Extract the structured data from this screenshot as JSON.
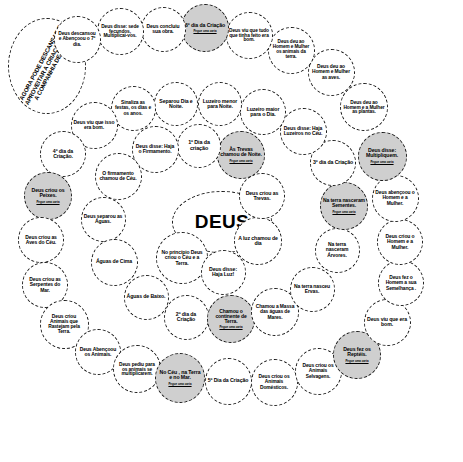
{
  "board": {
    "title": "DEUS",
    "draw_card_label": "Pegue uma carta",
    "colors": {
      "outline": "#1a1a1a",
      "highlight_fill": "#cfcfcf",
      "background": "#ffffff"
    },
    "center": {
      "label": "DEUS"
    },
    "start": {
      "label": "AGORA PODE DESCANSAR E APROVEITAR A CRIAÇÃO COM A COMPANHIA DE DEUS."
    },
    "nodes": [
      {
        "id": "n01",
        "label": "No princípio Deus criou o Céu e a Terra.",
        "highlight": false,
        "draw_card": false,
        "x": 182,
        "y": 258,
        "d": 52,
        "fs": 5.0
      },
      {
        "id": "n02",
        "label": "Deus disse: Haja Luz!",
        "highlight": false,
        "draw_card": false,
        "x": 223,
        "y": 272,
        "d": 45,
        "fs": 5.2
      },
      {
        "id": "n03",
        "label": "A luz chamou de dia",
        "highlight": false,
        "draw_card": false,
        "x": 258,
        "y": 241,
        "d": 48,
        "fs": 5.2
      },
      {
        "id": "n04",
        "label": "Deus criou as Trevas.",
        "highlight": false,
        "draw_card": false,
        "x": 262,
        "y": 196,
        "d": 46,
        "fs": 5.2
      },
      {
        "id": "n05",
        "label": "Às Trevas chamou de Noite.",
        "highlight": true,
        "draw_card": true,
        "x": 241,
        "y": 155,
        "d": 48,
        "fs": 5.2
      },
      {
        "id": "n06",
        "label": "1º Dia da criação",
        "highlight": false,
        "draw_card": false,
        "x": 199,
        "y": 146,
        "d": 44,
        "fs": 5.4
      },
      {
        "id": "n07",
        "label": "Deus disse: Haja o Firmamento.",
        "highlight": false,
        "draw_card": false,
        "x": 155,
        "y": 149,
        "d": 47,
        "fs": 5.0
      },
      {
        "id": "n08",
        "label": "O firmamento chamou de Céu.",
        "highlight": false,
        "draw_card": false,
        "x": 118,
        "y": 176,
        "d": 47,
        "fs": 5.0
      },
      {
        "id": "n09",
        "label": "Deus separou as Águas.",
        "highlight": false,
        "draw_card": false,
        "x": 103,
        "y": 219,
        "d": 45,
        "fs": 5.0
      },
      {
        "id": "n10",
        "label": "Águas de Cima",
        "highlight": false,
        "draw_card": false,
        "x": 114,
        "y": 262,
        "d": 47,
        "fs": 5.2
      },
      {
        "id": "n11",
        "label": "Águas de Baixo.",
        "highlight": false,
        "draw_card": false,
        "x": 146,
        "y": 297,
        "d": 45,
        "fs": 5.2
      },
      {
        "id": "n12",
        "label": "2º dia da Criação",
        "highlight": false,
        "draw_card": false,
        "x": 186,
        "y": 317,
        "d": 45,
        "fs": 5.2
      },
      {
        "id": "n13",
        "label": "Chamou o continente de Terra.",
        "highlight": true,
        "draw_card": true,
        "x": 231,
        "y": 319,
        "d": 48,
        "fs": 5.0
      },
      {
        "id": "n14",
        "label": "Chamou a Massa das águas de Mares.",
        "highlight": false,
        "draw_card": false,
        "x": 275,
        "y": 312,
        "d": 48,
        "fs": 4.9
      },
      {
        "id": "n15",
        "label": "Na terra nasceu Ervas.",
        "highlight": false,
        "draw_card": false,
        "x": 312,
        "y": 289,
        "d": 45,
        "fs": 5.0
      },
      {
        "id": "n16",
        "label": "Na terra nasceram Árvores.",
        "highlight": false,
        "draw_card": false,
        "x": 337,
        "y": 250,
        "d": 45,
        "fs": 5.0
      },
      {
        "id": "n17",
        "label": "Na terra nasceram Sementes.",
        "highlight": true,
        "draw_card": true,
        "x": 344,
        "y": 206,
        "d": 48,
        "fs": 5.0
      },
      {
        "id": "n18",
        "label": "3º dia da Criação",
        "highlight": false,
        "draw_card": false,
        "x": 333,
        "y": 163,
        "d": 46,
        "fs": 5.2
      },
      {
        "id": "n19",
        "label": "Deus disse: Haja Luzeiros no Céu.",
        "highlight": false,
        "draw_card": false,
        "x": 303,
        "y": 131,
        "d": 47,
        "fs": 5.0
      },
      {
        "id": "n20",
        "label": "Luzeiro maior para o Dia.",
        "highlight": false,
        "draw_card": false,
        "x": 263,
        "y": 112,
        "d": 46,
        "fs": 5.2
      },
      {
        "id": "n21",
        "label": "Luzeiro menor para Noite.",
        "highlight": false,
        "draw_card": false,
        "x": 220,
        "y": 104,
        "d": 44,
        "fs": 5.2
      },
      {
        "id": "n22",
        "label": "Separou Dia e Noite.",
        "highlight": false,
        "draw_card": false,
        "x": 176,
        "y": 104,
        "d": 44,
        "fs": 5.2
      },
      {
        "id": "n23",
        "label": "Sinaliza as festas, os dias e os anos.",
        "highlight": false,
        "draw_card": false,
        "x": 133,
        "y": 108,
        "d": 45,
        "fs": 4.9
      },
      {
        "id": "n24",
        "label": "Deus viu que isso era bom.",
        "highlight": false,
        "draw_card": false,
        "x": 94,
        "y": 125,
        "d": 47,
        "fs": 5.0
      },
      {
        "id": "n25",
        "label": "4º dia da Criação.",
        "highlight": false,
        "draw_card": false,
        "x": 63,
        "y": 154,
        "d": 46,
        "fs": 5.2
      },
      {
        "id": "n26",
        "label": "Deus criou os Peixes.",
        "highlight": true,
        "draw_card": true,
        "x": 48,
        "y": 196,
        "d": 48,
        "fs": 5.2
      },
      {
        "id": "n27",
        "label": "Deus criou as Aves do Céu.",
        "highlight": false,
        "draw_card": false,
        "x": 41,
        "y": 240,
        "d": 46,
        "fs": 5.0
      },
      {
        "id": "n28",
        "label": "Deus criou as Serpentes do Mar.",
        "highlight": false,
        "draw_card": false,
        "x": 45,
        "y": 285,
        "d": 46,
        "fs": 5.0
      },
      {
        "id": "n29",
        "label": "Deus criou Animais que Rastejam pela Terra.",
        "highlight": false,
        "draw_card": false,
        "x": 64,
        "y": 324,
        "d": 49,
        "fs": 4.9
      },
      {
        "id": "n30",
        "label": "Deus Abençoou os Animais.",
        "highlight": false,
        "draw_card": false,
        "x": 98,
        "y": 352,
        "d": 46,
        "fs": 5.0
      },
      {
        "id": "n31",
        "label": "Deus pediu para os animais se multiplicarem.",
        "highlight": false,
        "draw_card": false,
        "x": 137,
        "y": 369,
        "d": 48,
        "fs": 4.8
      },
      {
        "id": "n32",
        "label": "No Céu , na Terra e no Mar.",
        "highlight": true,
        "draw_card": true,
        "x": 180,
        "y": 378,
        "d": 50,
        "fs": 5.2
      },
      {
        "id": "n33",
        "label": "5º Dia da Criação",
        "highlight": false,
        "draw_card": false,
        "x": 228,
        "y": 381,
        "d": 47,
        "fs": 5.2
      },
      {
        "id": "n34",
        "label": "Deus criou os Animais Domésticos.",
        "highlight": false,
        "draw_card": false,
        "x": 274,
        "y": 382,
        "d": 47,
        "fs": 4.9
      },
      {
        "id": "n35",
        "label": "Deus criou os Animais Selvagens.",
        "highlight": false,
        "draw_card": false,
        "x": 318,
        "y": 371,
        "d": 47,
        "fs": 4.9
      },
      {
        "id": "n36",
        "label": "Deus fez os Reptéis.",
        "highlight": true,
        "draw_card": true,
        "x": 357,
        "y": 355,
        "d": 48,
        "fs": 5.2
      },
      {
        "id": "n37",
        "label": "Deus viu que era bom.",
        "highlight": false,
        "draw_card": false,
        "x": 387,
        "y": 322,
        "d": 47,
        "fs": 5.2
      },
      {
        "id": "n38",
        "label": "Deus fez o Homem a sua Semelhança .",
        "highlight": false,
        "draw_card": false,
        "x": 401,
        "y": 283,
        "d": 46,
        "fs": 4.9
      },
      {
        "id": "n39",
        "label": "Deus criou o Homem e a Mulher.",
        "highlight": false,
        "draw_card": false,
        "x": 400,
        "y": 242,
        "d": 46,
        "fs": 5.0
      },
      {
        "id": "n40",
        "label": "Deus abençoou o Homem e a Mulher.",
        "highlight": false,
        "draw_card": false,
        "x": 395,
        "y": 198,
        "d": 47,
        "fs": 4.9
      },
      {
        "id": "n41",
        "label": "Deus disse: Multipliquem.",
        "highlight": true,
        "draw_card": true,
        "x": 382,
        "y": 156,
        "d": 49,
        "fs": 5.2
      },
      {
        "id": "n42",
        "label": "Deus deu ao Homem e a Mulher as plantas.",
        "highlight": false,
        "draw_card": false,
        "x": 364,
        "y": 107,
        "d": 48,
        "fs": 4.8
      },
      {
        "id": "n43",
        "label": "Deus deu ao Homem e Mulher as aves.",
        "highlight": false,
        "draw_card": false,
        "x": 331,
        "y": 72,
        "d": 47,
        "fs": 4.9
      },
      {
        "id": "n44",
        "label": "Deus deu ao Homem e Mulher os animais da terra.",
        "highlight": false,
        "draw_card": false,
        "x": 291,
        "y": 50,
        "d": 47,
        "fs": 4.7
      },
      {
        "id": "n45",
        "label": "Deus viu que tudo que tinha feito era bom.",
        "highlight": false,
        "draw_card": false,
        "x": 249,
        "y": 35,
        "d": 47,
        "fs": 4.8
      },
      {
        "id": "n46",
        "label": "6º dia da Criação",
        "highlight": true,
        "draw_card": true,
        "x": 205,
        "y": 28,
        "d": 48,
        "fs": 5.2
      },
      {
        "id": "n47",
        "label": "Deus concluiu sua obra.",
        "highlight": false,
        "draw_card": false,
        "x": 163,
        "y": 29,
        "d": 45,
        "fs": 5.0
      },
      {
        "id": "n48",
        "label": "Deus disse: sede fecundos, Multiplicai-vos.",
        "highlight": false,
        "draw_card": false,
        "x": 120,
        "y": 31,
        "d": 47,
        "fs": 4.8
      },
      {
        "id": "n49",
        "label": "Deus descansou e Abençoou o 7º dia.",
        "highlight": false,
        "draw_card": false,
        "x": 77,
        "y": 39,
        "d": 47,
        "fs": 4.9
      }
    ]
  }
}
